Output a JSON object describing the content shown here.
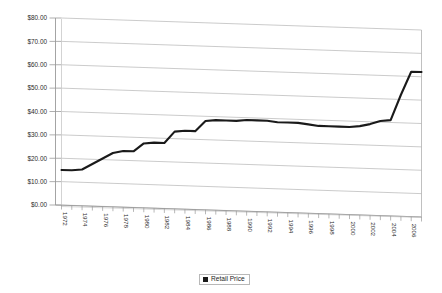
{
  "chart_data": {
    "type": "line",
    "title": "",
    "subtitle": "",
    "xlabel": "",
    "ylabel": "",
    "ylim": [
      0,
      80
    ],
    "ytick_labels": [
      "$0.00",
      "$10.00",
      "$20.00",
      "$30.00",
      "$40.00",
      "$50.00",
      "$60.00",
      "$70.00",
      "$80.00"
    ],
    "ytick_values": [
      0,
      10,
      20,
      30,
      40,
      50,
      60,
      70,
      80
    ],
    "grid": true,
    "legend_position": "bottom-center",
    "legend_entries": [
      "Retail Price"
    ],
    "x": [
      1972,
      1973,
      1974,
      1975,
      1976,
      1977,
      1978,
      1979,
      1980,
      1981,
      1982,
      1983,
      1984,
      1985,
      1986,
      1987,
      1988,
      1989,
      1990,
      1991,
      1992,
      1993,
      1994,
      1995,
      1996,
      1997,
      1998,
      1999,
      2000,
      2001,
      2002,
      2003,
      2004,
      2005,
      2006,
      2007
    ],
    "xtick_labels": [
      "1972",
      "1974",
      "1976",
      "1978",
      "1980",
      "1982",
      "1984",
      "1986",
      "1988",
      "1990",
      "1992",
      "1994",
      "1996",
      "1998",
      "2000",
      "2002",
      "2004",
      "2006"
    ],
    "xtick_label_interval": 2,
    "series": [
      {
        "name": "Retail Price",
        "color": "#1a1a1a",
        "values": [
          15.0,
          15.0,
          15.5,
          18.0,
          20.5,
          23.0,
          24.0,
          24.0,
          27.5,
          28.0,
          28.0,
          33.0,
          33.5,
          33.5,
          38.0,
          38.5,
          38.5,
          38.5,
          39.0,
          39.0,
          39.0,
          38.5,
          38.5,
          38.5,
          38.0,
          37.5,
          37.5,
          37.5,
          37.5,
          38.0,
          39.0,
          40.5,
          41.0,
          52.0,
          62.0,
          62.0
        ]
      }
    ]
  },
  "legend": {
    "label": "Retail Price",
    "swatch_color": "#1a1a1a"
  },
  "axes": {
    "y_axis_name": "price-axis",
    "x_axis_name": "year-axis"
  }
}
